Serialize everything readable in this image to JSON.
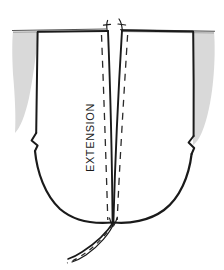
{
  "figure": {
    "type": "technical-sewing-pattern-diagram",
    "background_color": "#ffffff",
    "ink_color": "#1a1a1a",
    "shade_color": "#d9d9d9",
    "labels": [
      {
        "id": "extension",
        "text": "EXTENSION",
        "orientation": "rotated-90-ccw",
        "x": 94,
        "y": 172,
        "font_size": 11
      }
    ],
    "annotations": {
      "waistline_label": "",
      "notch_left": "notch-mark",
      "notch_right": "notch-mark"
    },
    "elements": {
      "waist_line": "horizontal top edge",
      "left_panel": "left pattern half",
      "right_panel": "right pattern half",
      "center_dart": "center opening between panels",
      "hem_curve": "U-shaped lower hem",
      "stitch_lines": "dashed seam allowance guides",
      "shading_left": "gray wedge upper left",
      "shading_right": "gray wedge upper right",
      "tail": "extension tail below hem"
    }
  }
}
